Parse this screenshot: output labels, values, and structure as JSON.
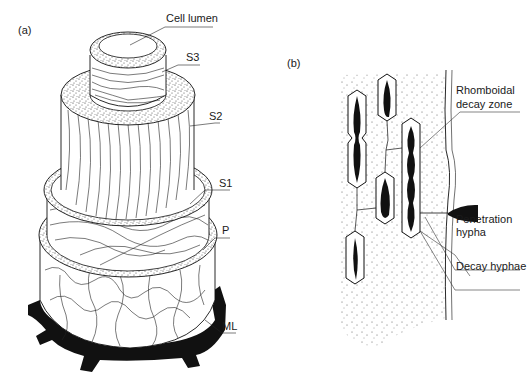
{
  "figure": {
    "panels": [
      {
        "id": "a",
        "letter": "(a)",
        "description": "Layered structure of a wood cell wall shown as stacked concentric cylinders",
        "labels": {
          "cell_lumen": "Cell lumen",
          "s3": "S3",
          "s2": "S2",
          "s1": "S1",
          "p": "P",
          "ml": "ML"
        }
      },
      {
        "id": "b",
        "letter": "(b)",
        "description": "Soft rot decay cavities in a cell wall with hyphae",
        "labels": {
          "rhomboidal_line1": "Rhomboidal",
          "rhomboidal_line2": "decay zone",
          "penetration_line1": "Penetration",
          "penetration_line2": "hypha",
          "decay_hyphae": "Decay hyphae"
        }
      }
    ],
    "colors": {
      "ink": "#111111",
      "background": "#ffffff",
      "stipple": "#333333"
    }
  }
}
